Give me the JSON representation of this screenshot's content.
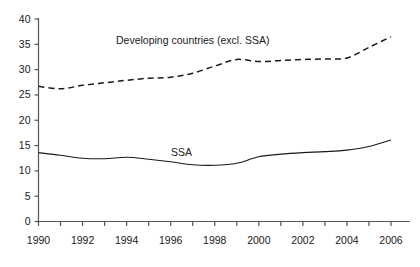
{
  "chart_data": {
    "type": "line",
    "title": "",
    "subtitle": "",
    "xlabel": "",
    "ylabel": "",
    "xlim": [
      1990,
      2006
    ],
    "ylim": [
      0,
      40
    ],
    "grid": false,
    "legend_position": "inline-annotations",
    "y_ticks": [
      0,
      5,
      10,
      15,
      20,
      25,
      30,
      35,
      40
    ],
    "y_tick_labels": [
      "0",
      "5",
      "10",
      "15",
      "20",
      "25",
      "30",
      "35",
      "40"
    ],
    "x_ticks": [
      1990,
      1991,
      1992,
      1993,
      1994,
      1995,
      1996,
      1997,
      1998,
      1999,
      2000,
      2001,
      2002,
      2003,
      2004,
      2005,
      2006
    ],
    "x_tick_labels": [
      "1990",
      "",
      "1992",
      "",
      "1994",
      "",
      "1996",
      "",
      "1998",
      "",
      "2000",
      "",
      "2002",
      "",
      "2004",
      "",
      "2006"
    ],
    "x_labeled_ticks": [
      "1990",
      "1992",
      "1994",
      "1996",
      "1998",
      "2000",
      "2002",
      "2004",
      "2006"
    ],
    "x": [
      1990,
      1991,
      1992,
      1993,
      1994,
      1995,
      1996,
      1997,
      1998,
      1999,
      2000,
      2001,
      2002,
      2003,
      2004,
      2005,
      2006
    ],
    "series": [
      {
        "name": "Developing countries (excl. SSA)",
        "label": "Developing countries (excl. SSA)",
        "style": "dashed",
        "color": "#1a1a1a",
        "values": [
          26.7,
          26.2,
          26.9,
          27.4,
          27.9,
          28.3,
          28.5,
          29.3,
          30.7,
          32.0,
          31.6,
          31.8,
          32.0,
          32.1,
          32.3,
          34.4,
          36.5
        ]
      },
      {
        "name": "SSA",
        "label": "SSA",
        "style": "solid",
        "color": "#1a1a1a",
        "values": [
          13.6,
          13.1,
          12.5,
          12.4,
          12.7,
          12.3,
          11.8,
          11.2,
          11.1,
          11.5,
          12.8,
          13.3,
          13.6,
          13.8,
          14.1,
          14.8,
          16.1
        ]
      }
    ],
    "annotations": [
      {
        "text": "Developing countries (excl. SSA)",
        "x_px": 116,
        "y_px": 35
      },
      {
        "text": "SSA",
        "x_px": 171,
        "y_px": 147
      }
    ]
  },
  "axis": {
    "line_color": "#555555"
  }
}
